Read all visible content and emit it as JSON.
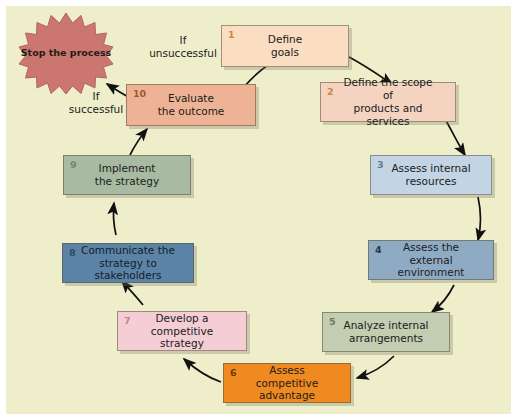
{
  "diagram": {
    "background_color": "#eeeecb",
    "terminator": {
      "name": "stop-process-star",
      "text": "Stop\nthe\nprocess",
      "fill_color": "#cc7670",
      "shape": "starburst"
    },
    "edge_labels": [
      {
        "id": "if-unsuccessful",
        "text": "If\nunsuccessful"
      },
      {
        "id": "if-successful",
        "text": "If\nsuccessful"
      }
    ],
    "steps": [
      {
        "number": "1",
        "label": "Define\ngoals",
        "color": "#fbddc2"
      },
      {
        "number": "2",
        "label": "Define the scope of\nproducts and services",
        "color": "#f4d3c0"
      },
      {
        "number": "3",
        "label": "Assess internal\nresources",
        "color": "#c3d4e4"
      },
      {
        "number": "4",
        "label": "Assess the\nexternal environment",
        "color": "#8fabc4"
      },
      {
        "number": "5",
        "label": "Analyze internal\narrangements",
        "color": "#c3cdb2"
      },
      {
        "number": "6",
        "label": "Assess competitive\nadvantage",
        "color": "#ef8a21"
      },
      {
        "number": "7",
        "label": "Develop a\ncompetitive strategy",
        "color": "#f4ced4"
      },
      {
        "number": "8",
        "label": "Communicate the\nstrategy to stakeholders",
        "color": "#5b83a6"
      },
      {
        "number": "9",
        "label": "Implement\nthe strategy",
        "color": "#a8bba2"
      },
      {
        "number": "10",
        "label": "Evaluate\nthe outcome",
        "color": "#eeb395"
      }
    ]
  }
}
